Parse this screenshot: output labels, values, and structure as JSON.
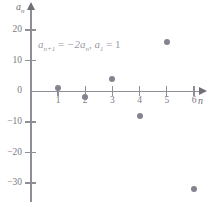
{
  "chart_data": {
    "type": "scatter",
    "title": "",
    "annotation": "aₙ₊₁ = −2aₙ, a₁ = 1",
    "xlabel": "n",
    "ylabel": "aₙ",
    "x": [
      1,
      2,
      3,
      4,
      5,
      6
    ],
    "values": [
      1,
      -2,
      4,
      -8,
      16,
      -32
    ],
    "categories": [
      "1",
      "2",
      "3",
      "4",
      "5",
      "6"
    ],
    "xlim": [
      0,
      6.8
    ],
    "ylim": [
      -34,
      24
    ],
    "xticks": [
      1,
      2,
      3,
      4,
      5,
      6
    ],
    "yticks": [
      20,
      10,
      0,
      -10,
      -20,
      -30
    ],
    "xtick_labels": [
      "1",
      "2",
      "3",
      "4",
      "5",
      "6"
    ],
    "ytick_labels": [
      "20",
      "10",
      "0",
      "−10",
      "−20",
      "−30"
    ],
    "grid": false,
    "legend": "none",
    "point_color": "#84838f",
    "axis_color": "#8e8e96",
    "label_color": "#7b7b85"
  },
  "formula": {
    "lhs_base": "a",
    "lhs_sub": "n+1",
    "equals": "=",
    "rhs": "−2a",
    "rhs_sub": "n",
    "comma": ", ",
    "init_base": "a",
    "init_sub": "1",
    "init_equals": "= 1"
  },
  "axes": {
    "y_name": "a",
    "y_name_sub": "n",
    "x_name": "n"
  }
}
